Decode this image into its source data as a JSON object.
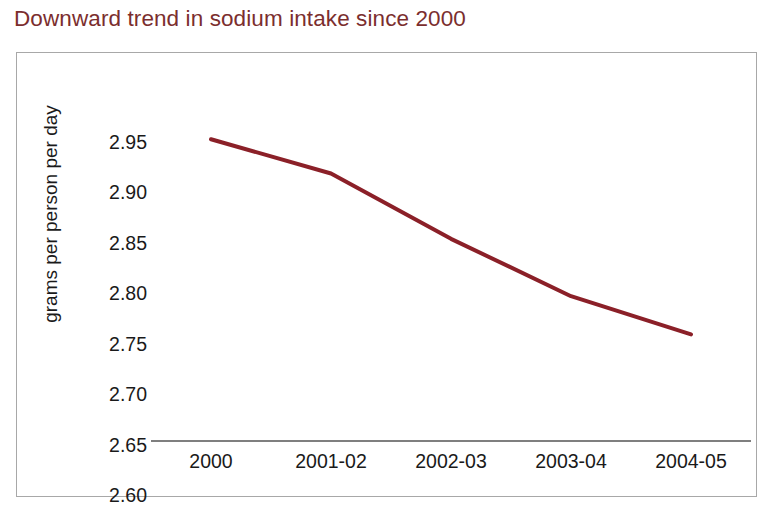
{
  "chart_data": {
    "type": "line",
    "title": "Downward trend in sodium intake since 2000",
    "xlabel": "",
    "ylabel": "grams per person per day",
    "categories": [
      "2000",
      "2001-02",
      "2002-03",
      "2003-04",
      "2004-05"
    ],
    "values": [
      2.9,
      2.866,
      2.801,
      2.744,
      2.706
    ],
    "series": [
      {
        "name": "sodium intake",
        "values": [
          2.9,
          2.866,
          2.801,
          2.744,
          2.706
        ],
        "color": "#8B2028"
      }
    ],
    "ylim": [
      2.6,
      2.95
    ],
    "ytick_labels": [
      "2.95",
      "2.90",
      "2.85",
      "2.80",
      "2.75",
      "2.70",
      "2.65",
      "2.60"
    ],
    "ytick_values": [
      2.95,
      2.9,
      2.85,
      2.8,
      2.75,
      2.7,
      2.65,
      2.6
    ],
    "ytick_step": 0.05,
    "grid": false,
    "legend": "none",
    "axis_line_color": "#555555",
    "frame_color": "#A8A8A8",
    "title_color": "#7B2E2E",
    "line_color": "#8B2028",
    "line_width": 4
  }
}
